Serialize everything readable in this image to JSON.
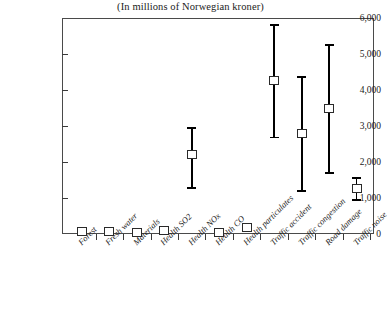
{
  "chart_data": {
    "type": "scatter",
    "title": "(In millions of Norwegian kroner)",
    "subtitle": "",
    "xlabel": "",
    "ylabel": "",
    "ylim": [
      0,
      6000
    ],
    "ytick_values": [
      0,
      1000,
      2000,
      3000,
      4000,
      5000,
      6000
    ],
    "ytick_labels": [
      "0",
      "1,000",
      "2,000",
      "3,000",
      "4,000",
      "5,000",
      "6,000"
    ],
    "grid": false,
    "legend": "none",
    "marker_style": "open-square-with-error-bars",
    "categories": [
      "Forest",
      "Fresh water",
      "Materials",
      "Health SO2",
      "Health NOx",
      "Health CO",
      "Health particulates",
      "Traffic accident",
      "Traffic congestion",
      "Road damage",
      "Traffic noise"
    ],
    "series": [
      {
        "name": "Estimate",
        "values": [
          60,
          60,
          50,
          90,
          2200,
          50,
          170,
          4250,
          2800,
          3500,
          1250
        ]
      },
      {
        "name": "Lower bound",
        "values": [
          20,
          20,
          20,
          40,
          1280,
          20,
          70,
          2680,
          1200,
          1700,
          950
        ]
      },
      {
        "name": "Upper bound",
        "values": [
          110,
          110,
          90,
          150,
          2950,
          90,
          280,
          5800,
          4350,
          5250,
          1550
        ]
      }
    ]
  },
  "colors": {
    "marker_edge": "#2a2a2a",
    "error_bar": "#000000",
    "axis": "#4a4a4a",
    "text": "#1b1b1b",
    "background": "#ffffff"
  }
}
